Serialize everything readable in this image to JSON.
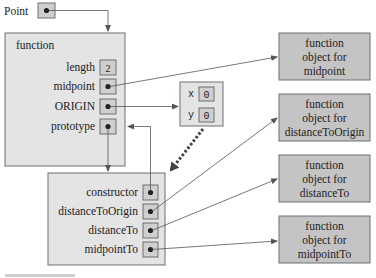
{
  "diagram": {
    "variable": {
      "name": "Point"
    },
    "function_object": {
      "title": "function",
      "properties": [
        {
          "name": "length",
          "value": "2"
        },
        {
          "name": "midpoint",
          "value": "ref"
        },
        {
          "name": "ORIGIN",
          "value": "ref"
        },
        {
          "name": "prototype",
          "value": "ref"
        }
      ]
    },
    "origin_object": {
      "properties": [
        {
          "name": "x",
          "value": "0"
        },
        {
          "name": "y",
          "value": "0"
        }
      ]
    },
    "prototype_object": {
      "properties": [
        {
          "name": "constructor",
          "value": "ref"
        },
        {
          "name": "distanceToOrigin",
          "value": "ref"
        },
        {
          "name": "distanceTo",
          "value": "ref"
        },
        {
          "name": "midpointTo",
          "value": "ref"
        }
      ]
    },
    "function_objects": [
      {
        "line1": "function",
        "line2": "object for",
        "line3": "midpoint"
      },
      {
        "line1": "function",
        "line2": "object for",
        "line3": "distanceToOrigin"
      },
      {
        "line1": "function",
        "line2": "object for",
        "line3": "distanceTo"
      },
      {
        "line1": "function",
        "line2": "object for",
        "line3": "midpointTo"
      }
    ],
    "colors": {
      "object_fill": "#e4e4e4",
      "value_fill": "#cfcfcf",
      "function_fill": "#c4c4c4",
      "stroke": "#6e6e6e",
      "arrow": "#555555"
    }
  }
}
